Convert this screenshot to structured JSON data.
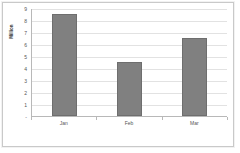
{
  "chart_data": {
    "type": "bar",
    "title": "",
    "subtitle": "",
    "xlabel": "",
    "ylabel": "Million",
    "categories": [
      "Jan",
      "Feb",
      "Mar"
    ],
    "values": [
      8.5,
      4.5,
      6.5
    ],
    "ylim": [
      0,
      9
    ],
    "ytick_labels": [
      "9",
      "8",
      "7",
      "6",
      "5",
      "4",
      "3",
      "2",
      "1",
      "-"
    ],
    "ytick_values": [
      9,
      8,
      7,
      6,
      5,
      4,
      3,
      2,
      1,
      0
    ],
    "grid": true,
    "legend": false,
    "legend_position": "none",
    "bar_color": "#808080",
    "bar_border_color": "#6e6e6e",
    "gridline_color": "#e2e2e2",
    "axis_color": "#b8b8b8",
    "plot_background": "#ffffff",
    "frame_border_color": "#c9c9c9"
  }
}
